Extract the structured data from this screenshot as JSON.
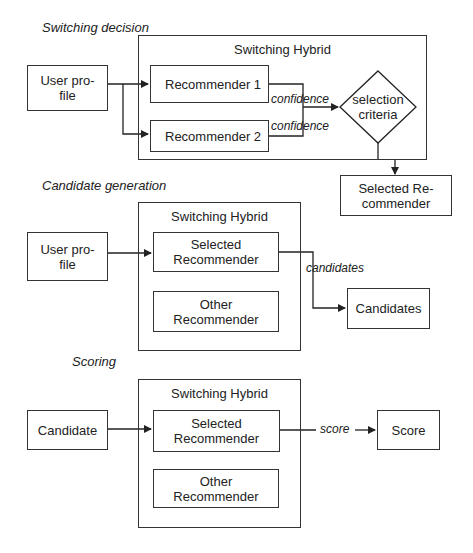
{
  "sections": {
    "decision": {
      "label": "Switching decision",
      "hybrid_title": "Switching Hybrid",
      "input": "User pro-\nfile",
      "recommender_1": "Recommender 1",
      "recommender_2": "Recommender 2",
      "edge_1": "confidence",
      "edge_2": "confidence",
      "decision_node": "selection\ncriteria",
      "output": "Selected Re-\ncommender"
    },
    "generation": {
      "label": "Candidate generation",
      "hybrid_title": "Switching Hybrid",
      "input": "User pro-\nfile",
      "selected": "Selected\nRecommender",
      "other": "Other\nRecommender",
      "edge": "candidates",
      "output": "Candidates"
    },
    "scoring": {
      "label": "Scoring",
      "hybrid_title": "Switching Hybrid",
      "input": "Candidate",
      "selected": "Selected\nRecommender",
      "other": "Other\nRecommender",
      "edge": "score",
      "output": "Score"
    }
  },
  "colors": {
    "stroke": "#333333",
    "background": "#ffffff"
  }
}
